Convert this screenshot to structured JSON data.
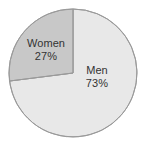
{
  "chart_data": {
    "type": "pie",
    "title": "",
    "subtitle": "",
    "xlabel": "",
    "ylabel": "",
    "categories": [
      "Men",
      "Women"
    ],
    "values": [
      73,
      27
    ],
    "unit": "%",
    "legend_position": "none",
    "grid": false,
    "labels_inside": true,
    "start_angle_deg": 0,
    "direction": "clockwise",
    "slices": [
      {
        "name": "Men",
        "value": 73,
        "value_label": "73%",
        "color": "#e8e8e8",
        "start_angle_deg": 0,
        "end_angle_deg": 262.8
      },
      {
        "name": "Women",
        "value": 27,
        "value_label": "27%",
        "color": "#c8c8c8",
        "start_angle_deg": 262.8,
        "end_angle_deg": 360
      }
    ]
  },
  "figure": {
    "background_color": "#ffffff",
    "outline_color": "#9a9a9a",
    "text_color": "#333333",
    "center_x": 73,
    "center_y": 73,
    "radius": 64
  },
  "labels": {
    "women": {
      "name": "Women",
      "value_label": "27%"
    },
    "men": {
      "name": "Men",
      "value_label": "73%"
    }
  }
}
